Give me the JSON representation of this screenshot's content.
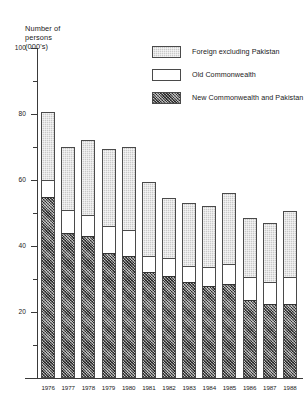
{
  "chart_data": {
    "type": "bar",
    "subtype": "stacked",
    "title": "",
    "ylabel": "Number of persons (000's)",
    "ylabel_lines": [
      "Number of",
      "persons",
      "(000's)"
    ],
    "xlabel": "",
    "ylim": [
      0,
      100
    ],
    "ytick_major": [
      0,
      20,
      40,
      60,
      80,
      100
    ],
    "ytick_major_labels": [
      "",
      "20",
      "40",
      "60",
      "80",
      "100"
    ],
    "ytick_minor": [
      10,
      30,
      50,
      70,
      90
    ],
    "grid": false,
    "legend_position": "top-right",
    "categories": [
      "1976",
      "1977",
      "1978",
      "1979",
      "1980",
      "1981",
      "1982",
      "1983",
      "1984",
      "1985",
      "1986",
      "1987",
      "1988"
    ],
    "series": [
      {
        "name": "New Commonwealth and Pakistan",
        "fill": "hatch-dark",
        "color": "#6d6d6d",
        "values": [
          55,
          44,
          43,
          38,
          37,
          32,
          31,
          29,
          28,
          28.5,
          23.5,
          22.5,
          22.5
        ]
      },
      {
        "name": "Old Commonwealth",
        "fill": "white",
        "color": "#ffffff",
        "values": [
          5,
          7,
          6.5,
          8,
          8,
          5,
          5.5,
          5,
          5.5,
          6,
          7,
          6.5,
          8
        ]
      },
      {
        "name": "Foreign excluding Pakistan",
        "fill": "hatch-light",
        "color": "#c9c9c9",
        "values": [
          20.5,
          19,
          22.5,
          23.5,
          25,
          22.5,
          18,
          19,
          18.5,
          21.5,
          18,
          18,
          20
        ]
      }
    ],
    "totals": [
      80.5,
      70,
      72,
      69.5,
      70,
      59.5,
      54.5,
      53,
      52,
      56,
      48.5,
      47,
      50.5
    ]
  },
  "legend": {
    "items": [
      {
        "label": "Foreign excluding Pakistan",
        "swatch": "hatch-light"
      },
      {
        "label": "Old Commonwealth",
        "swatch": "white"
      },
      {
        "label": "New Commonwealth and Pakistan",
        "swatch": "hatch-dark"
      }
    ]
  },
  "axis": {
    "y_title_line1": "Number of",
    "y_title_line2": "persons",
    "y_title_line3": "(000's)"
  },
  "colors": {
    "axis": "#3a3a3a",
    "foreign": "#c9c9c9",
    "old_commonwealth": "#ffffff",
    "new_commonwealth": "#6d6d6d",
    "background": "#ffffff"
  }
}
